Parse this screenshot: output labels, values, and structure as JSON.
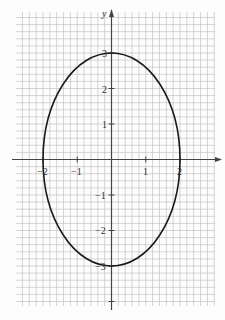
{
  "chart_data": {
    "type": "line",
    "title": "",
    "equation": "x^2/4 + y^2/9 = 1",
    "xlabel": "",
    "ylabel": "y",
    "xlim": [
      -2.8,
      3.0
    ],
    "ylim": [
      -4.2,
      4.1
    ],
    "x_ticks": [
      -2,
      -1,
      1,
      2
    ],
    "x_tick_labels": [
      "−2",
      "−1",
      "1",
      "2"
    ],
    "y_ticks": [
      3,
      2,
      1,
      -1,
      -2,
      -3
    ],
    "y_tick_labels": [
      "3",
      "2",
      "1",
      "−1",
      "−2",
      "−3"
    ],
    "grid": true,
    "minor_grid_per_unit": 5,
    "series": [
      {
        "name": "ellipse",
        "center": [
          0,
          0
        ],
        "semi_axis_x": 2,
        "semi_axis_y": 3,
        "points": [
          [
            0,
            3
          ],
          [
            1,
            2.6
          ],
          [
            1.732,
            1.5
          ],
          [
            2,
            0
          ],
          [
            1.732,
            -1.5
          ],
          [
            1,
            -2.6
          ],
          [
            0,
            -3
          ],
          [
            -1,
            -2.6
          ],
          [
            -1.732,
            -1.5
          ],
          [
            -2,
            0
          ],
          [
            -1.732,
            1.5
          ],
          [
            -1,
            2.6
          ]
        ]
      }
    ],
    "legend": null
  },
  "labels": {
    "y_axis": "y",
    "x_neg2": "−2",
    "x_neg1": "−1",
    "x_1": "1",
    "x_2": "2",
    "y_3": "3",
    "y_2": "2",
    "y_1": "1",
    "y_neg1": "−1",
    "y_neg2": "−2",
    "y_neg3": "−3"
  },
  "colors": {
    "grid": "#b8b8b8",
    "axis": "#444444",
    "curve": "#1a1a1a",
    "background": "#fdfdfd"
  }
}
